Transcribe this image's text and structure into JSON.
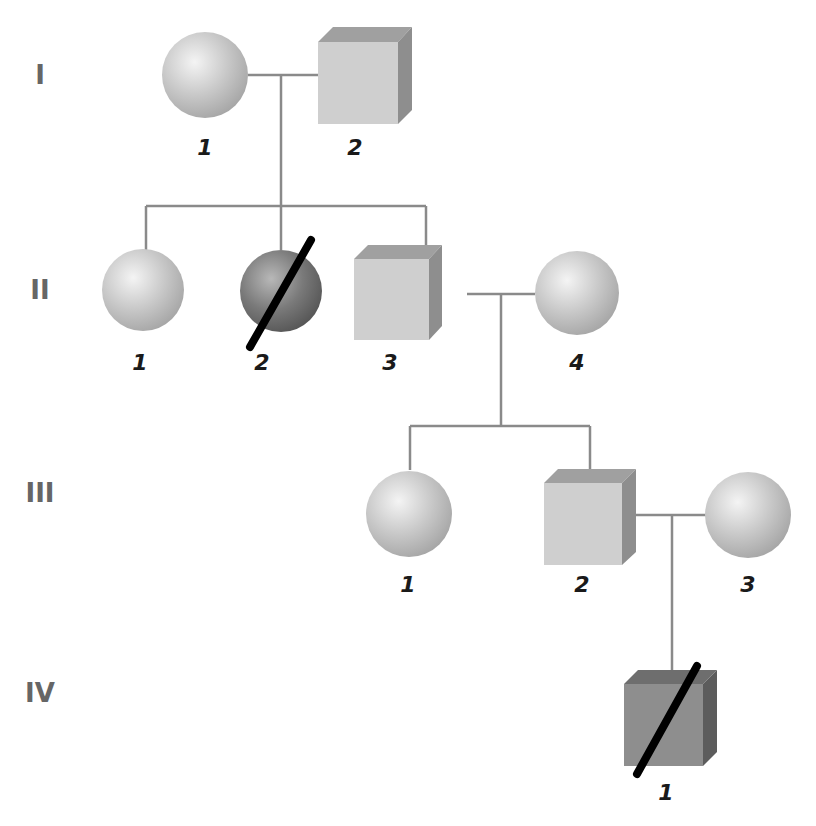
{
  "diagram": {
    "type": "pedigree",
    "generations": [
      {
        "label": "I",
        "individuals": [
          {
            "id": "I-1",
            "number": "1",
            "sex": "female",
            "affected": false,
            "deceased": false
          },
          {
            "id": "I-2",
            "number": "2",
            "sex": "male",
            "affected": false,
            "deceased": false
          }
        ]
      },
      {
        "label": "II",
        "individuals": [
          {
            "id": "II-1",
            "number": "1",
            "sex": "female",
            "affected": false,
            "deceased": false
          },
          {
            "id": "II-2",
            "number": "2",
            "sex": "female",
            "affected": true,
            "deceased": true
          },
          {
            "id": "II-3",
            "number": "3",
            "sex": "male",
            "affected": false,
            "deceased": false
          },
          {
            "id": "II-4",
            "number": "4",
            "sex": "female",
            "affected": false,
            "deceased": false
          }
        ]
      },
      {
        "label": "III",
        "individuals": [
          {
            "id": "III-1",
            "number": "1",
            "sex": "female",
            "affected": false,
            "deceased": false
          },
          {
            "id": "III-2",
            "number": "2",
            "sex": "male",
            "affected": false,
            "deceased": false
          },
          {
            "id": "III-3",
            "number": "3",
            "sex": "female",
            "affected": false,
            "deceased": false
          }
        ]
      },
      {
        "label": "IV",
        "individuals": [
          {
            "id": "IV-1",
            "number": "1",
            "sex": "male",
            "affected": true,
            "deceased": true
          }
        ]
      }
    ],
    "matings": [
      {
        "partners": [
          "I-1",
          "I-2"
        ],
        "children": [
          "II-1",
          "II-2",
          "II-3"
        ]
      },
      {
        "partners": [
          "II-3",
          "II-4"
        ],
        "children": [
          "III-1",
          "III-2"
        ]
      },
      {
        "partners": [
          "III-2",
          "III-3"
        ],
        "children": [
          "IV-1"
        ]
      }
    ],
    "colors": {
      "unaffected_fill": "#cfcfcf",
      "affected_fill": "#7a7a7a",
      "line": "#8a8a8a",
      "slash": "#000000",
      "generation_label": "#666666"
    }
  }
}
